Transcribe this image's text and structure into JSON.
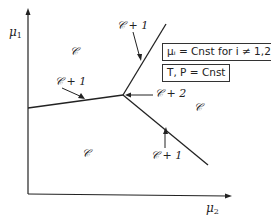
{
  "diagram": {
    "axes": {
      "y_label": "μ",
      "y_sub": "1",
      "x_label": "μ",
      "x_sub": "2"
    },
    "regions": {
      "upper_left": "𝒞",
      "right": "𝒞",
      "lower": "𝒞"
    },
    "boundary_labels": {
      "upper": "𝒞 + 1",
      "left": "𝒞 + 1",
      "lower_right": "𝒞 + 1",
      "triple_point": "𝒞 + 2"
    },
    "condition_boxes": {
      "box1": "μᵢ = Cnst for i ≠ 1,2",
      "box2": "T, P = Cnst"
    }
  }
}
